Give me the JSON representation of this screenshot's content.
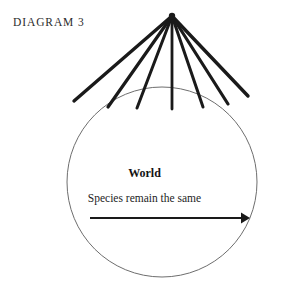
{
  "figure": {
    "title": "DIAGRAM 3",
    "type": "conceptual-diagram",
    "caption_labels": {
      "world": "World",
      "species": "Species remain the same"
    },
    "colors": {
      "ray_stroke": "#1a1a1a",
      "circle_stroke": "#6e6e6e",
      "arrow_stroke": "#1a1a1a",
      "text": "#1b1b1b",
      "background": "#ffffff"
    },
    "circle": {
      "label": "World",
      "cx": 162,
      "cy": 182,
      "r": 95,
      "stroke_width": 1
    },
    "apex": {
      "x": 172,
      "y": 16
    },
    "rays": [
      {
        "id": "ray-1",
        "x2": 74,
        "y2": 101,
        "width": 3.4
      },
      {
        "id": "ray-2",
        "x2": 108,
        "y2": 107,
        "width": 3.2
      },
      {
        "id": "ray-3",
        "x2": 137,
        "y2": 108,
        "width": 3.0
      },
      {
        "id": "ray-4",
        "x2": 172,
        "y2": 109,
        "width": 2.8
      },
      {
        "id": "ray-5",
        "x2": 203,
        "y2": 107,
        "width": 3.0
      },
      {
        "id": "ray-6",
        "x2": 228,
        "y2": 104,
        "width": 3.2
      },
      {
        "id": "ray-7",
        "x2": 248,
        "y2": 96,
        "width": 3.4
      }
    ],
    "arrow": {
      "label": "Species remain the same",
      "x1": 90,
      "x2": 250,
      "y": 218,
      "stroke_width": 2.2,
      "head": "triangle-right"
    }
  }
}
